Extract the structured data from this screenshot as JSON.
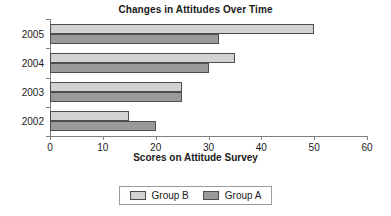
{
  "chart_data": {
    "type": "bar",
    "orientation": "horizontal",
    "title": "Changes in Attitudes Over Time",
    "xlabel": "Scores on Attitude Survey",
    "ylabel": "",
    "categories": [
      "2005",
      "2004",
      "2003",
      "2002"
    ],
    "series": [
      {
        "name": "Group B",
        "color": "#d2d2d2",
        "values": [
          50,
          35,
          25,
          15
        ]
      },
      {
        "name": "Group A",
        "color": "#9a9a9a",
        "values": [
          32,
          30,
          25,
          20
        ]
      }
    ],
    "xlim": [
      0,
      60
    ],
    "xticks": [
      0,
      10,
      20,
      30,
      40,
      50,
      60
    ],
    "xtick_labels": [
      "0",
      "10",
      "20",
      "30",
      "40",
      "50",
      "60"
    ],
    "grid": false,
    "legend_position": "bottom"
  },
  "legend": {
    "items": [
      {
        "label": "Group B",
        "color": "#d2d2d2"
      },
      {
        "label": "Group A",
        "color": "#9a9a9a"
      }
    ]
  }
}
